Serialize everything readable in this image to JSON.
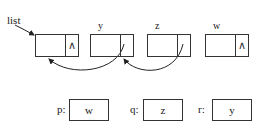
{
  "diagram": {
    "type": "linked-list",
    "head_label": "list",
    "nodes": [
      {
        "id": "n0",
        "label": "",
        "next": "∧"
      },
      {
        "id": "n1",
        "label": "y",
        "next": ""
      },
      {
        "id": "n2",
        "label": "z",
        "next": ""
      },
      {
        "id": "n3",
        "label": "w",
        "next": "∧"
      }
    ],
    "links": [
      {
        "from": "y.next",
        "to": "list-node"
      },
      {
        "from": "z.next",
        "to": "y.next"
      }
    ],
    "pointers": [
      {
        "name": "p:",
        "value": "w"
      },
      {
        "name": "q:",
        "value": "z"
      },
      {
        "name": "r:",
        "value": "y"
      }
    ]
  }
}
